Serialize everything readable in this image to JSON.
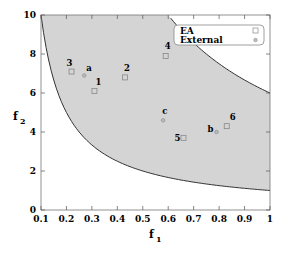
{
  "chart_data": {
    "type": "scatter",
    "title": "",
    "xlabel": "f1",
    "ylabel": "f2",
    "xlim": [
      0.1,
      1
    ],
    "ylim": [
      0,
      10
    ],
    "xticks": [
      "0.1",
      "0.2",
      "0.3",
      "0.4",
      "0.5",
      "0.6",
      "0.7",
      "0.8",
      "0.9",
      "1"
    ],
    "yticks": [
      "0",
      "2",
      "4",
      "6",
      "8",
      "10"
    ],
    "grid": false,
    "legend_position": "top-right",
    "shaded_region": {
      "lower_bound": "f2 = 1/f1",
      "upper_bound": "f2 = 6/f1",
      "color": "#d4d4d4"
    },
    "series": [
      {
        "name": "EA",
        "marker": "square",
        "points": [
          {
            "label": "1",
            "x": 0.31,
            "y": 6.1
          },
          {
            "label": "2",
            "x": 0.43,
            "y": 6.8
          },
          {
            "label": "3",
            "x": 0.22,
            "y": 7.1
          },
          {
            "label": "4",
            "x": 0.59,
            "y": 7.9
          },
          {
            "label": "5",
            "x": 0.66,
            "y": 3.7
          },
          {
            "label": "6",
            "x": 0.83,
            "y": 4.3
          }
        ]
      },
      {
        "name": "External",
        "marker": "circle",
        "points": [
          {
            "label": "a",
            "x": 0.27,
            "y": 6.9
          },
          {
            "label": "b",
            "x": 0.79,
            "y": 4.0
          },
          {
            "label": "c",
            "x": 0.58,
            "y": 4.6
          }
        ]
      }
    ]
  },
  "legend": {
    "ea": "EA",
    "external": "External"
  },
  "axes": {
    "xlabel_main": "f",
    "xlabel_sub": "1",
    "ylabel_main": "f",
    "ylabel_sub": "2"
  }
}
